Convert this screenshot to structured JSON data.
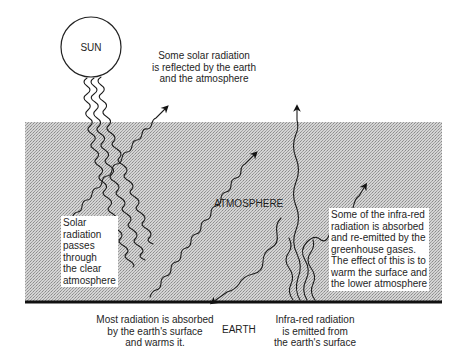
{
  "diagram": {
    "colors": {
      "atmosphere_fill": "#c9c9c9",
      "ground_line": "#111111",
      "line": "#1a1a1a",
      "background": "#ffffff"
    },
    "sun": {
      "label": "SUN"
    },
    "atmosphere": {
      "label": "ATMOSPHERE"
    },
    "earth": {
      "label": "EARTH"
    },
    "annotations": {
      "reflected": [
        "Some solar radiation",
        "is reflected by the earth",
        "and the atmosphere"
      ],
      "passes": [
        "Solar",
        "radiation",
        "passes",
        "through",
        "the clear",
        "atmosphere"
      ],
      "absorbed": [
        "Most radiation is absorbed",
        "by the earth's surface",
        "and warms it."
      ],
      "infrared_emitted": [
        "Infra-red radiation",
        "is emitted from",
        "the earth's surface"
      ],
      "greenhouse": [
        "Some of the infra-red",
        "radiation is absorbed",
        "and re-emitted by the",
        "greenhouse gases.",
        "The effect of this is to",
        "warm the surface and",
        "the lower atmosphere"
      ]
    },
    "arrows": [
      {
        "name": "incoming-solar-radiation",
        "direction": "sun to earth surface"
      },
      {
        "name": "reflected-by-atmosphere",
        "direction": "up-right, exits atmosphere"
      },
      {
        "name": "reflected-by-earth",
        "direction": "up-right, exits atmosphere"
      },
      {
        "name": "infrared-escaping",
        "direction": "straight up, exits atmosphere"
      },
      {
        "name": "infrared-absorbed-reemitted",
        "direction": "up-right within atmosphere"
      },
      {
        "name": "infrared-reemitted-down",
        "direction": "down-left to earth surface"
      }
    ]
  }
}
